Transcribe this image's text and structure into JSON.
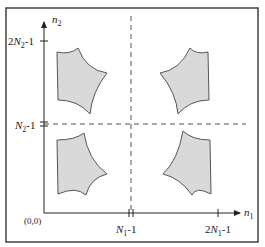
{
  "figure": {
    "frame": {
      "x": 6,
      "y": 8,
      "width": 252,
      "height": 234,
      "stroke": "#333333"
    },
    "axes": {
      "origin_label": "(0,0)",
      "x_axis": {
        "label_base": "n",
        "label_sub": "1"
      },
      "y_axis": {
        "label_base": "n",
        "label_sub": "2"
      },
      "x_ticks": [
        {
          "base": "N",
          "sub": "1",
          "suffix": "-1",
          "prefix": ""
        },
        {
          "base": "N",
          "sub": "1",
          "suffix": "-1",
          "prefix": "2"
        }
      ],
      "y_ticks": [
        {
          "base": "N",
          "sub": "2",
          "suffix": "-1",
          "prefix": ""
        },
        {
          "base": "N",
          "sub": "2",
          "suffix": "-1",
          "prefix": "2"
        }
      ]
    },
    "regions": [
      {
        "name": "top-left",
        "fill": "#d9d9d9"
      },
      {
        "name": "top-right",
        "fill": "#d9d9d9"
      },
      {
        "name": "bottom-left",
        "fill": "#d9d9d9"
      },
      {
        "name": "bottom-right",
        "fill": "#d9d9d9"
      }
    ],
    "dashed_lines": {
      "vertical_at": "N1-1",
      "horizontal_at": "N2-1"
    }
  }
}
